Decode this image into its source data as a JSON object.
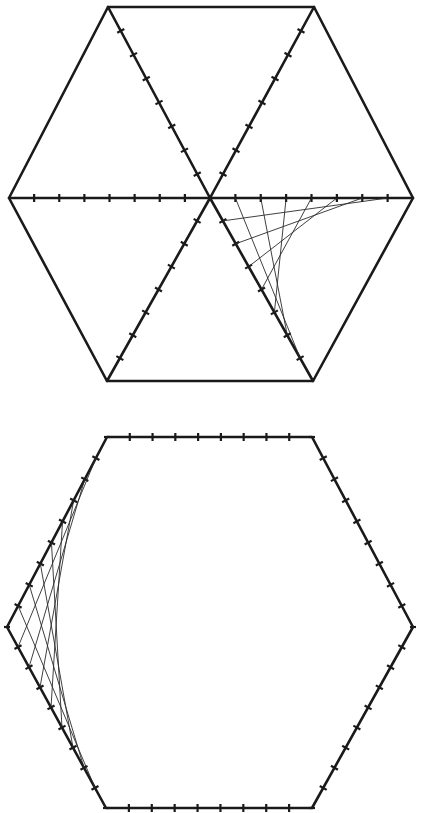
{
  "figure": {
    "width": 426,
    "height": 813,
    "background": "#ffffff",
    "line_color": "#1a1a1a",
    "string_color": "#2a2a2a"
  },
  "diagrams": [
    {
      "name": "hexagon-with-spokes",
      "vertices": {
        "top_left": [
          108,
          7
        ],
        "top_right": [
          314,
          7
        ],
        "right": [
          413,
          198
        ],
        "bottom_right": [
          313,
          381
        ],
        "bottom_left": [
          107,
          381
        ],
        "left": [
          9,
          198
        ]
      },
      "center": [
        210,
        198
      ],
      "outline_ticks": 0,
      "spoke_segments": 8,
      "spokes": [
        "left",
        "top_left",
        "top_right",
        "right",
        "bottom_right",
        "bottom_left"
      ],
      "marked_spokes": [
        "left",
        "top_left",
        "top_right",
        "right",
        "bottom_right",
        "bottom_left"
      ],
      "stitching": {
        "from": "center-to-right",
        "to": "center-to-bottom_right",
        "segments": 8,
        "description": "Curve stitching between the right spoke and the lower-right spoke"
      }
    },
    {
      "name": "hexagon-with-marked-edges",
      "vertices": {
        "top_left": [
          107,
          437
        ],
        "top_right": [
          312,
          437
        ],
        "right": [
          413,
          627
        ],
        "bottom_right": [
          312,
          808
        ],
        "bottom_left": [
          106,
          808
        ],
        "left": [
          7,
          627
        ]
      },
      "edge_segments": 9,
      "stitching": {
        "from": "left-to-top_left",
        "to": "left-to-bottom_left",
        "segments": 9,
        "description": "Curve stitching between the two left edges meeting at the left vertex"
      }
    }
  ]
}
